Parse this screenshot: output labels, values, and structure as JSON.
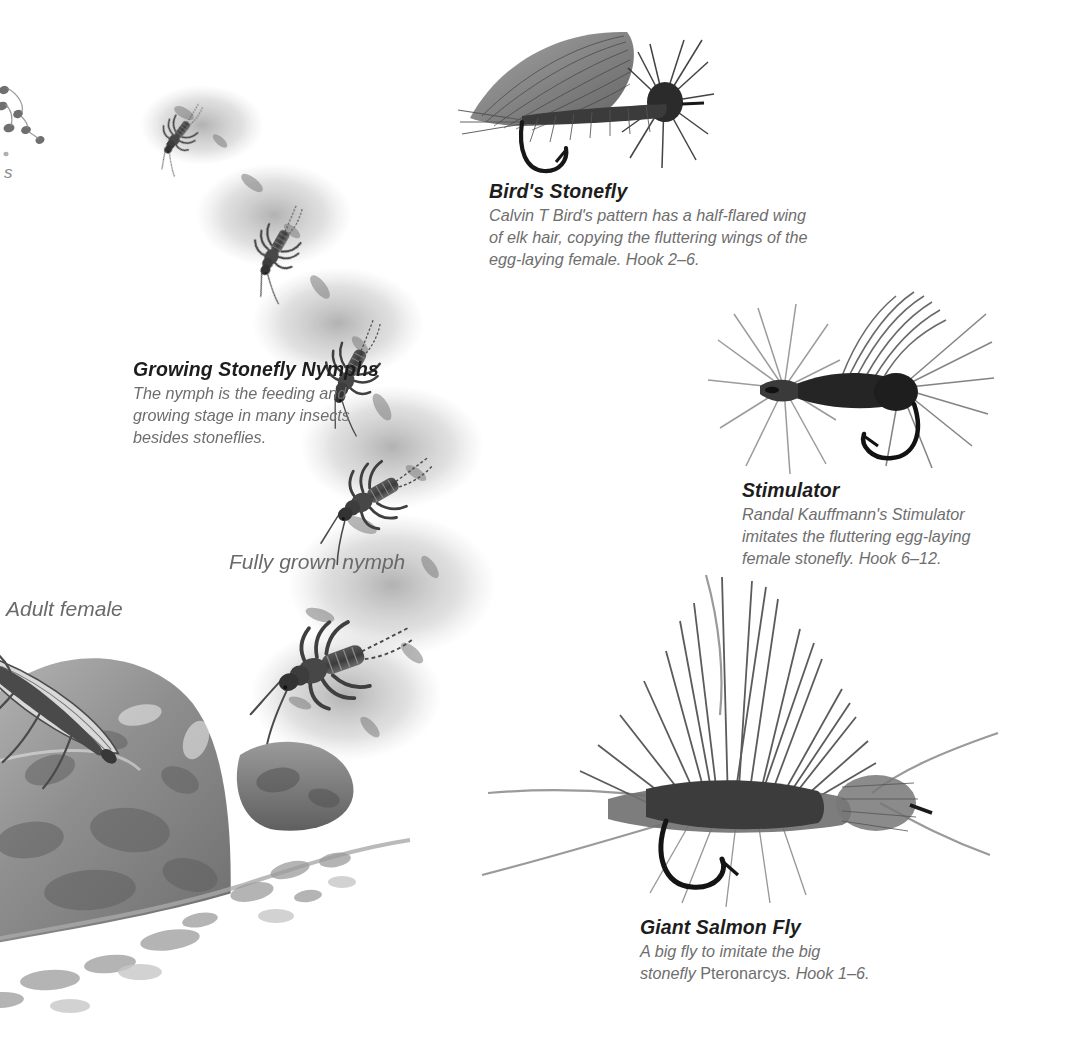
{
  "page": {
    "background": "#ffffff",
    "heading_color": "#1d1d1d",
    "body_color": "#6e6e6e",
    "label_color": "#6a6a6a"
  },
  "captions": [
    {
      "id": "birds-stonefly",
      "title": "Bird's Stonefly",
      "body_lines": [
        "Calvin T Bird's pattern has a half-flared wing",
        "of elk hair, copying the fluttering wings of the",
        "egg-laying female. Hook 2–6."
      ]
    },
    {
      "id": "growing-stonefly-nymphs",
      "title": "Growing Stonefly Nymphs",
      "body_lines": [
        "The nymph is the feeding and",
        "growing stage in many insects",
        "besides stoneflies."
      ]
    },
    {
      "id": "stimulator",
      "title": "Stimulator",
      "body_lines": [
        "Randal Kauffmann's Stimulator",
        "imitates the fluttering egg-laying",
        "female stonefly. Hook 6–12."
      ]
    },
    {
      "id": "giant-salmon-fly",
      "title": "Giant Salmon Fly",
      "body_line_1": "A big fly to imitate the big",
      "body_line_2_pre": "stonefly ",
      "body_line_2_genus": "Pteronarcys",
      "body_line_2_post": ". Hook 1–6."
    }
  ],
  "labels": [
    {
      "id": "fully-grown-nymph",
      "text": "Fully grown nymph"
    },
    {
      "id": "adult-female",
      "text": "Adult female"
    }
  ],
  "edge_fragment": {
    "text": "s"
  },
  "artwork": [
    {
      "id": "birds-stonefly-photo",
      "kind": "fly-photograph",
      "subject": "dry fly with elk hair wing and hackle collar"
    },
    {
      "id": "stimulator-photo",
      "kind": "fly-photograph",
      "subject": "bushy hackled dry fly facing left"
    },
    {
      "id": "giant-salmon-fly-photo",
      "kind": "fly-photograph",
      "subject": "large deer hair fly with antennae"
    },
    {
      "id": "growing-nymphs-illustration",
      "kind": "illustration",
      "subject": "arc of five stonefly nymphs increasing in size on stream bed"
    },
    {
      "id": "adult-female-illustration",
      "kind": "illustration",
      "subject": "adult female stonefly resting on a boulder beside water"
    },
    {
      "id": "egg-cluster-fragment",
      "kind": "illustration",
      "subject": "cropped egg cluster at page edge"
    }
  ]
}
